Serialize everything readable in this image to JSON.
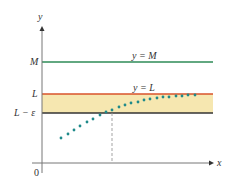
{
  "chart_data": {
    "type": "scatter",
    "title": "",
    "xlabel": "x",
    "ylabel": "y",
    "origin_label": "0",
    "horizontal_lines": [
      {
        "name": "M",
        "axis_label": "M",
        "line_label": "y = M",
        "color": "#2e8b57",
        "py": 62
      },
      {
        "name": "L",
        "axis_label": "L",
        "line_label": "y = L",
        "color": "#d9532b",
        "py": 94
      },
      {
        "name": "L-eps",
        "axis_label": "L − ε",
        "line_label": "",
        "color": "#333333",
        "py": 113
      }
    ],
    "band": {
      "from": "L-eps",
      "to": "L",
      "color": "#f6e7b0"
    },
    "sequence_points_px": [
      [
        61,
        138
      ],
      [
        68,
        134
      ],
      [
        74,
        130
      ],
      [
        80,
        126
      ],
      [
        87,
        122
      ],
      [
        93,
        119
      ],
      [
        100,
        115
      ],
      [
        106,
        112
      ],
      [
        112,
        110
      ],
      [
        119,
        107
      ],
      [
        125,
        105
      ],
      [
        131,
        103
      ],
      [
        138,
        102
      ],
      [
        144,
        100
      ],
      [
        150,
        99
      ],
      [
        157,
        98
      ],
      [
        163,
        97
      ],
      [
        169,
        97
      ],
      [
        176,
        96
      ],
      [
        182,
        96
      ],
      [
        188,
        95
      ],
      [
        195,
        95
      ]
    ],
    "point_color": "#1f8a8a",
    "dashed_marker": {
      "px": 112,
      "from_py": 113,
      "to_py": 163,
      "color": "#999999"
    },
    "axes": {
      "origin_px": [
        42,
        163
      ],
      "x_end_px": 214,
      "y_top_px": 26,
      "color": "#777777"
    }
  },
  "labels": {
    "y_axis": "y",
    "x_axis": "x",
    "origin": "0",
    "M": "M",
    "L": "L",
    "L_eps": "L − ε",
    "yM": "y = M",
    "yL": "y = L"
  }
}
